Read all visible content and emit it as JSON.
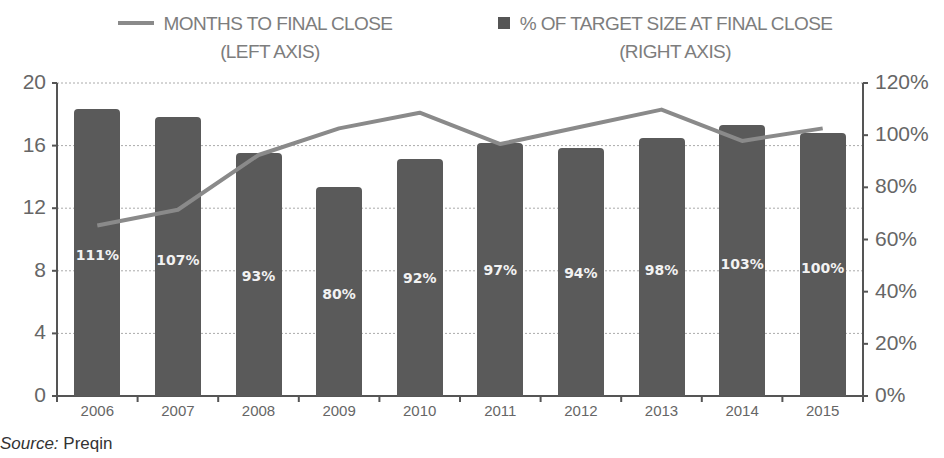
{
  "legend": {
    "line_series": {
      "line1": "MONTHS TO FINAL CLOSE",
      "line2": "(LEFT AXIS)"
    },
    "bar_series": {
      "line1": "% OF TARGET SIZE AT FINAL CLOSE",
      "line2": "(RIGHT AXIS)"
    }
  },
  "left_axis_ticks": [
    "20",
    "16",
    "12",
    "8",
    "4",
    "0"
  ],
  "right_axis_ticks": [
    "120%",
    "100%",
    "80%",
    "60%",
    "40%",
    "20%",
    "0%"
  ],
  "source": {
    "label": "Source:",
    "value": "Preqin"
  },
  "colors": {
    "bar": "#5a5a5a",
    "line": "#8a8a8a",
    "axis": "#555555",
    "grid": "#aaaaaa"
  },
  "chart_data": {
    "type": "bar+line",
    "title": "",
    "categories": [
      "2006",
      "2007",
      "2008",
      "2009",
      "2010",
      "2011",
      "2012",
      "2013",
      "2014",
      "2015"
    ],
    "series": [
      {
        "name": "% OF TARGET SIZE AT FINAL CLOSE (RIGHT AXIS)",
        "type": "bar",
        "axis": "right",
        "values": [
          111,
          107,
          93,
          80,
          92,
          97,
          94,
          98,
          103,
          100
        ],
        "labels": [
          "111%",
          "107%",
          "93%",
          "80%",
          "92%",
          "97%",
          "94%",
          "98%",
          "103%",
          "100%"
        ],
        "rendered_height_pct": [
          110,
          107,
          93,
          80,
          91,
          97,
          95,
          99,
          104,
          101
        ]
      },
      {
        "name": "MONTHS TO FINAL CLOSE (LEFT AXIS)",
        "type": "line",
        "axis": "left",
        "values": [
          10.9,
          11.9,
          15.4,
          17.1,
          18.1,
          16.1,
          17.2,
          18.3,
          16.3,
          17.1
        ]
      }
    ],
    "xlabel": "",
    "ylabel_left": "",
    "ylabel_right": "",
    "ylim_left": [
      0,
      20
    ],
    "ylim_right": [
      0,
      120
    ],
    "grid": true,
    "legend_position": "top"
  }
}
